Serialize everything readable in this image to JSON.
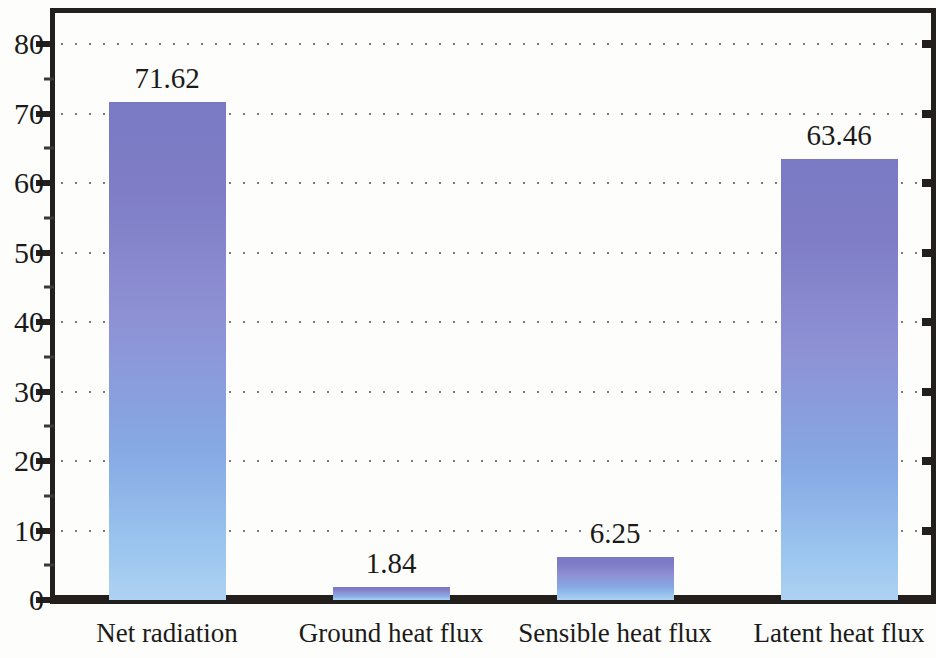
{
  "chart_data": {
    "type": "bar",
    "title": "",
    "subtitle": "",
    "xlabel": "",
    "ylabel": "",
    "categories": [
      "Net radiation",
      "Ground heat flux",
      "Sensible heat flux",
      "Latent heat flux"
    ],
    "values": [
      71.62,
      1.84,
      6.25,
      63.46
    ],
    "value_labels": [
      "71.62",
      "1.84",
      "6.25",
      "63.46"
    ],
    "ylim": [
      0,
      80
    ],
    "ytick_labels": [
      "0",
      "10",
      "20",
      "30",
      "40",
      "50",
      "60",
      "70",
      "80"
    ],
    "ytick_values": [
      0,
      10,
      20,
      30,
      40,
      50,
      60,
      70,
      80
    ],
    "grid": "horizontal-dotted",
    "legend": "none",
    "bar_color_top": "#7a79c3",
    "bar_color_bottom": "#aed2f2",
    "axis_color": "#231f1d",
    "gridline_color": "#7d7a76",
    "background_color": "#fdfdfb",
    "right_axis_ticks": true,
    "right_axis_tick_labels": false
  }
}
